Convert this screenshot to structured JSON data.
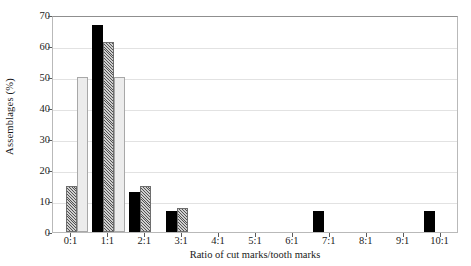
{
  "chart_data": {
    "type": "bar",
    "title": "",
    "xlabel": "Ratio of cut marks/tooth marks",
    "ylabel": "Assemblages (%)",
    "categories": [
      "0:1",
      "1:1",
      "2:1",
      "3:1",
      "4:1",
      "5:1",
      "6:1",
      "7:1",
      "8:1",
      "9:1",
      "10:1"
    ],
    "ylim": [
      0,
      70
    ],
    "yticks": [
      0,
      10,
      20,
      30,
      40,
      50,
      60,
      70
    ],
    "grid": true,
    "legend": "none",
    "series": [
      {
        "name": "series-black",
        "style": "solid-black",
        "color": "#000000",
        "values": [
          0,
          66.7,
          13.0,
          6.7,
          0,
          0,
          0,
          6.7,
          0,
          0,
          6.7
        ]
      },
      {
        "name": "series-hatched",
        "style": "hatched-gray",
        "color": "#cfcfcf",
        "values": [
          15.0,
          61.2,
          15.0,
          7.7,
          0,
          0,
          0,
          0,
          0,
          0,
          0
        ]
      },
      {
        "name": "series-light",
        "style": "light-gray",
        "color": "#ececec",
        "values": [
          50.0,
          50.0,
          0,
          0,
          0,
          0,
          0,
          0,
          0,
          0,
          0
        ]
      }
    ]
  }
}
